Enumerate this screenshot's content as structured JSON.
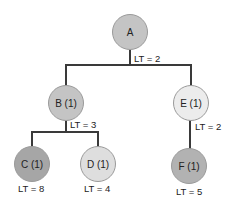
{
  "diagram": {
    "type": "tree",
    "nodes": [
      {
        "id": "A",
        "label": "A",
        "color": "#c4c4c4"
      },
      {
        "id": "B",
        "label": "B (1)",
        "color": "#c4c4c4"
      },
      {
        "id": "C",
        "label": "C (1)",
        "color": "#a6a6a6"
      },
      {
        "id": "D",
        "label": "D (1)",
        "color": "#dedede"
      },
      {
        "id": "E",
        "label": "E (1)",
        "color": "#ececec"
      },
      {
        "id": "F",
        "label": "F (1)",
        "color": "#b2b2b2"
      }
    ],
    "edges": [
      {
        "from": "A",
        "to": "B"
      },
      {
        "from": "A",
        "to": "E"
      },
      {
        "from": "B",
        "to": "C"
      },
      {
        "from": "B",
        "to": "D"
      },
      {
        "from": "E",
        "to": "F"
      }
    ],
    "labels": {
      "a_lt": "LT = 2",
      "b_lt": "LT = 3",
      "e_lt": "LT = 2",
      "c_lt": "LT = 8",
      "d_lt": "LT = 4",
      "f_lt": "LT = 5"
    }
  }
}
